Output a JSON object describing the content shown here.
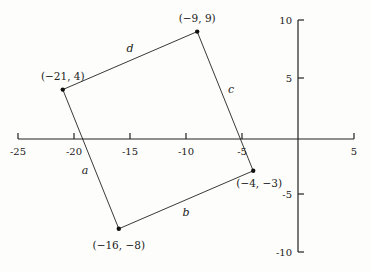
{
  "chart_data": {
    "type": "scatter",
    "title": "",
    "xlabel": "",
    "ylabel": "",
    "xlim": [
      -25,
      5
    ],
    "ylim": [
      -10,
      10
    ],
    "grid": false,
    "x_ticks": [
      -25,
      -20,
      -15,
      -10,
      -5,
      5
    ],
    "x_tick_labels": [
      "-25",
      "-20",
      "-15",
      "-10",
      "-5",
      "5"
    ],
    "y_ticks": [
      10,
      5,
      -5,
      -10
    ],
    "y_tick_labels": [
      "10",
      "5",
      "-5",
      "-10"
    ],
    "polygon": {
      "closed": true,
      "vertices": [
        {
          "x": -21,
          "y": 4,
          "label": "(−21, 4)"
        },
        {
          "x": -9,
          "y": 9,
          "label": "(−9, 9)"
        },
        {
          "x": -4,
          "y": -3,
          "label": "(−4, −3)"
        },
        {
          "x": -16,
          "y": -8,
          "label": "(−16, −8)"
        }
      ],
      "sides": [
        {
          "name": "d",
          "from": [
            -21,
            4
          ],
          "to": [
            -9,
            9
          ]
        },
        {
          "name": "c",
          "from": [
            -9,
            9
          ],
          "to": [
            -4,
            -3
          ]
        },
        {
          "name": "b",
          "from": [
            -4,
            -3
          ],
          "to": [
            -16,
            -8
          ]
        },
        {
          "name": "a",
          "from": [
            -16,
            -8
          ],
          "to": [
            -21,
            4
          ]
        }
      ]
    },
    "series": [
      {
        "name": "vertices",
        "x": [
          -21,
          -9,
          -4,
          -16
        ],
        "y": [
          4,
          9,
          -3,
          -8
        ]
      }
    ]
  }
}
